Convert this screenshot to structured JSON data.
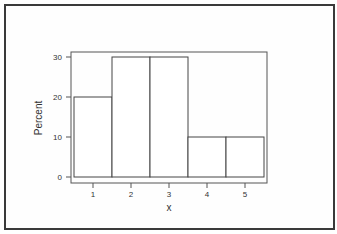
{
  "chart_data": {
    "type": "bar",
    "subtype": "histogram",
    "title": "",
    "xlabel": "x",
    "ylabel": "Percent",
    "categories": [
      "1",
      "2",
      "3",
      "4",
      "5"
    ],
    "values": [
      20,
      30,
      30,
      10,
      10
    ],
    "ylim": [
      0,
      30
    ],
    "yticks": [
      "0",
      "10",
      "20",
      "30"
    ],
    "xticks": [
      "1",
      "2",
      "3",
      "4",
      "5"
    ],
    "grid": false,
    "legend": null,
    "colors": {
      "bar_fill": "#ffffff",
      "bar_edge": "#444444",
      "frame": "#555555"
    }
  }
}
